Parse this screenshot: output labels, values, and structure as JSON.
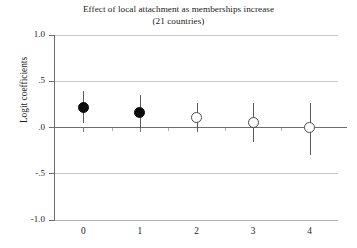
{
  "chart_data": {
    "type": "scatter",
    "title": "Effect of local attachment as memberships increase",
    "subtitle": "(21 countries)",
    "xlabel": "",
    "ylabel": "Logit coefficients",
    "categories": [
      "0",
      "1",
      "2",
      "3",
      "4"
    ],
    "x": [
      0,
      1,
      2,
      3,
      4
    ],
    "values": [
      0.22,
      0.16,
      0.11,
      0.05,
      0.0
    ],
    "ci_low": [
      0.05,
      0.0,
      -0.04,
      -0.16,
      -0.3
    ],
    "ci_high": [
      0.4,
      0.35,
      0.27,
      0.26,
      0.26
    ],
    "marker_styles": [
      "filled",
      "filled",
      "hollow",
      "hollow",
      "hollow"
    ],
    "ylim": [
      -1.0,
      1.0
    ],
    "xlim": [
      -0.5,
      4.5
    ],
    "yticks": [
      1.0,
      0.5,
      0.0,
      -0.5,
      -1.0
    ],
    "ytick_labels": [
      "1.0",
      ".5",
      ".0",
      "-.5",
      "-1.0"
    ],
    "xtick_labels": [
      "0",
      "1",
      "2",
      "3",
      "4"
    ],
    "grid": true,
    "zero_line": true,
    "legend": null,
    "annotations": []
  },
  "colors": {
    "background": "#ffffff",
    "text": "#1b1b1b",
    "grid": "#c9c9c9",
    "axis": "#6d6d6d",
    "marker_filled": "#0a0a0a",
    "marker_hollow_edge": "#4a4a4a",
    "errorbar": "#5a5a5a"
  }
}
